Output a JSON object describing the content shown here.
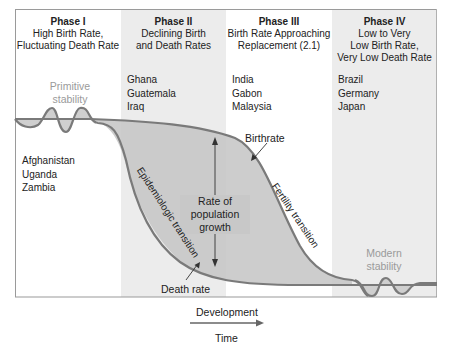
{
  "phases": [
    {
      "title": "Phase I",
      "desc": "High Birth Rate,\nFluctuating Death Rate",
      "countries": [
        "Afghanistan",
        "Uganda",
        "Zambia"
      ],
      "shaded": false
    },
    {
      "title": "Phase II",
      "desc": "Declining Birth\nand Death Rates",
      "countries": [
        "Ghana",
        "Guatemala",
        "Iraq"
      ],
      "shaded": true
    },
    {
      "title": "Phase III",
      "desc": "Birth Rate Approaching\nReplacement (2.1)",
      "countries": [
        "India",
        "Gabon",
        "Malaysia"
      ],
      "shaded": false
    },
    {
      "title": "Phase IV",
      "desc": "Low to Very\nLow Birth Rate,\nVery Low Death Rate",
      "countries": [
        "Brazil",
        "Germany",
        "Japan"
      ],
      "shaded": true
    }
  ],
  "labels": {
    "primitive_stability": [
      "Primitive",
      "stability"
    ],
    "modern_stability": [
      "Modern",
      "stability"
    ],
    "birthrate": "Birthrate",
    "death_rate": "Death rate",
    "rate_of_growth": [
      "Rate of",
      "population",
      "growth"
    ],
    "epidemiologic_transition": "Epidemiologic transition",
    "fertility_transition": "Fertility transition"
  },
  "x_axis": {
    "top_label": "Development",
    "bottom_label": "Time"
  },
  "colors": {
    "phase_shade": "#ececec",
    "curve": "#7a7a7a",
    "fill": "#c8c8c8",
    "frame": "#9a9a9a",
    "stability_text": "#9a9a9a"
  }
}
